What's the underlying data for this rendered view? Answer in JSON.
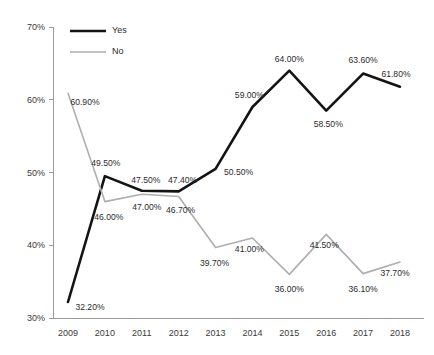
{
  "chart_data": {
    "type": "line",
    "title": "",
    "subtitle": "",
    "xlabel": "",
    "ylabel": "",
    "categories": [
      "2009",
      "2010",
      "2011",
      "2012",
      "2013",
      "2014",
      "2015",
      "2016",
      "2017",
      "2018"
    ],
    "ylim": [
      30,
      70
    ],
    "y_ticks": [
      30,
      40,
      50,
      60,
      70
    ],
    "y_tick_labels": [
      "30%",
      "40%",
      "50%",
      "60%",
      "70%"
    ],
    "grid": false,
    "legend_position": "top-left",
    "value_suffix": "%",
    "series": [
      {
        "name": "Yes",
        "color": "#141414",
        "values": [
          32.2,
          49.5,
          47.5,
          47.4,
          50.5,
          59.0,
          64.0,
          58.5,
          63.6,
          61.8
        ],
        "value_labels": [
          "32.20%",
          "49.50%",
          "47.50%",
          "47.40%",
          "50.50%",
          "59.00%",
          "64.00%",
          "58.50%",
          "63.60%",
          "61.80%"
        ],
        "label_offsets": [
          {
            "dx": 22,
            "dy": 8
          },
          {
            "dx": 1,
            "dy": -10
          },
          {
            "dx": 4,
            "dy": -8
          },
          {
            "dx": 4,
            "dy": -8
          },
          {
            "dx": 23,
            "dy": 6
          },
          {
            "dx": -3,
            "dy": -9
          },
          {
            "dx": 0,
            "dy": -9
          },
          {
            "dx": 2,
            "dy": 16
          },
          {
            "dx": 0,
            "dy": -11
          },
          {
            "dx": -4,
            "dy": -10
          }
        ]
      },
      {
        "name": "No",
        "color": "#aeaeae",
        "values": [
          60.9,
          46.0,
          47.0,
          46.7,
          39.7,
          41.0,
          36.0,
          41.5,
          36.1,
          37.7
        ],
        "value_labels": [
          "60.90%",
          "46.00%",
          "47.00%",
          "46.70%",
          "39.70%",
          "41.00%",
          "36.00%",
          "41.50%",
          "36.10%",
          "37.70%"
        ],
        "label_offsets": [
          {
            "dx": 17,
            "dy": 12
          },
          {
            "dx": 4,
            "dy": 18
          },
          {
            "dx": 5,
            "dy": 16
          },
          {
            "dx": 2,
            "dy": 16
          },
          {
            "dx": -1,
            "dy": 19
          },
          {
            "dx": -3,
            "dy": 14
          },
          {
            "dx": 0,
            "dy": 18
          },
          {
            "dx": -2,
            "dy": 14
          },
          {
            "dx": 0,
            "dy": 18
          },
          {
            "dx": -5,
            "dy": 14
          }
        ]
      }
    ],
    "legend": [
      {
        "label": "Yes",
        "color": "#141414"
      },
      {
        "label": "No",
        "color": "#aeaeae"
      }
    ]
  }
}
